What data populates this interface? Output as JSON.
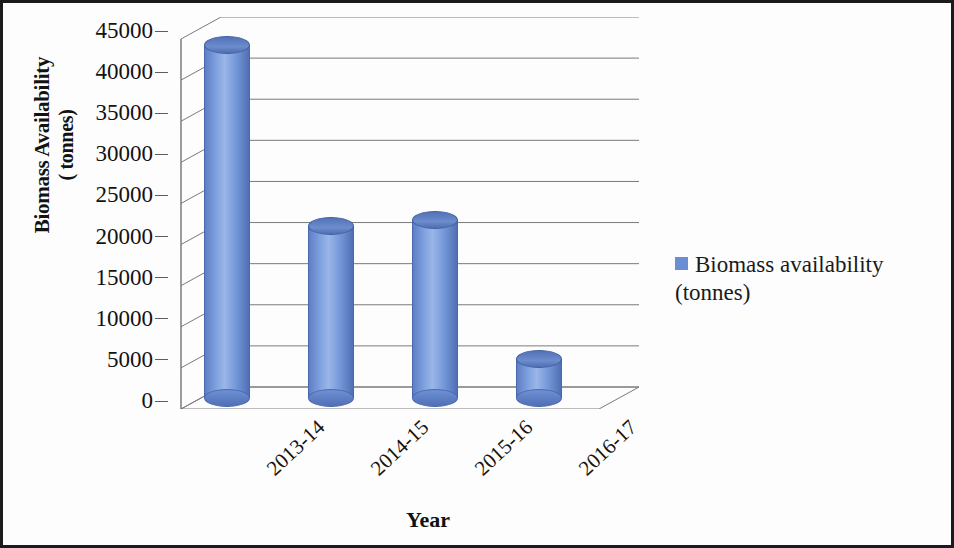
{
  "chart_data": {
    "type": "bar",
    "title": "",
    "subtitle": "",
    "xlabel": "Year",
    "ylabel": "Biomass Availability ( tonnes)",
    "ylabel_line1": "Biomass Availability",
    "ylabel_line2": "( tonnes)",
    "categories": [
      "2013-14",
      "2014-15",
      "2015-16",
      "2016-17"
    ],
    "values": [
      44000,
      22000,
      22800,
      5800
    ],
    "series": [
      {
        "name": "Biomass availability (tonnes)",
        "values": [
          44000,
          22000,
          22800,
          5800
        ]
      }
    ],
    "ylim": [
      0,
      45000
    ],
    "ytick_values": [
      45000,
      40000,
      35000,
      30000,
      25000,
      20000,
      15000,
      10000,
      5000,
      0
    ],
    "ytick_labels": [
      "45000",
      "40000",
      "35000",
      "30000",
      "25000",
      "20000",
      "15000",
      "10000",
      "5000",
      "0"
    ],
    "ytick_step": 5000,
    "grid": true,
    "grid_axis": "y",
    "legend_position": "right",
    "legend": [
      {
        "label_line1": "Biomass availability",
        "label_line2": "(tonnes)",
        "label": "Biomass availability (tonnes)",
        "color": "#6b8dd2"
      }
    ],
    "style": "3d-cylinder",
    "xtick_rotation": -43,
    "colors": {
      "bar_fill": "#7396d8",
      "bar_highlight": "#9ab6e8",
      "bar_shadow": "#4f6eb2",
      "bar_cap": "#5372b8",
      "gridline": "#7a7a7a",
      "axis": "#5d5d5d",
      "text": "#131313",
      "background": "#fdfdfd",
      "border": "#1b1b1b"
    }
  }
}
